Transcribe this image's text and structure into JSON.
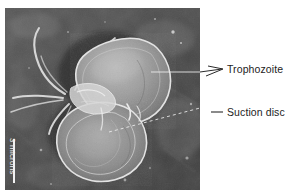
{
  "figure": {
    "kind": "scanning-electron-micrograph",
    "background_color": "#ffffff"
  },
  "micrograph": {
    "plate_color": "#4b4b4b",
    "specimen_color": "#9a9a9a",
    "highlight_color": "#e8e8e8",
    "shadow_color": "#262626"
  },
  "callouts": [
    {
      "id": "trophozoite",
      "label": "Trophozoite",
      "pointer": "arrowhead",
      "line_style": "solid"
    },
    {
      "id": "suction-disc",
      "label": "Suction disc",
      "pointer": "dash",
      "line_style": "dashed"
    }
  ],
  "scalebar": {
    "label": "3 microns",
    "orientation": "vertical",
    "bar_color": "#f2f2f2",
    "text_color": "#f0f0f0"
  }
}
